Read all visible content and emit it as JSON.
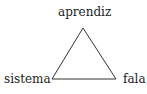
{
  "diagram": {
    "type": "triangle",
    "vertices": {
      "top": "aprendiz",
      "bottom_left": "sistema",
      "bottom_right": "fala"
    },
    "stroke_color": "#333333",
    "text_color": "#222222"
  }
}
